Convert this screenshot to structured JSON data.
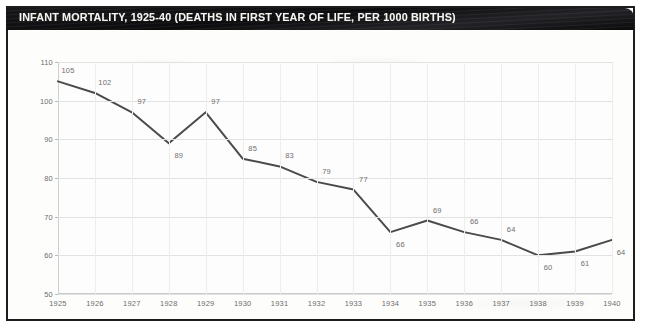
{
  "title": "INFANT MORTALITY, 1925-40 (DEATHS IN FIRST YEAR OF LIFE, PER 1000 BIRTHS)",
  "colors": {
    "banner_background": "#101012",
    "banner_text": "#f3f3f0",
    "line": "#4a4a4a",
    "gridline": "#e2e2e2",
    "tick_text": "#6d6d6d",
    "data_label_text": "#6f6f6f",
    "panel_background": "#fdfdfd",
    "card_border": "#1d1d1d"
  },
  "chart_data": {
    "type": "line",
    "title": "INFANT MORTALITY, 1925-40 (DEATHS IN FIRST YEAR OF LIFE, PER 1000 BIRTHS)",
    "xlabel": "",
    "ylabel": "",
    "x": [
      1925,
      1926,
      1927,
      1928,
      1929,
      1930,
      1931,
      1932,
      1933,
      1934,
      1935,
      1936,
      1937,
      1938,
      1939,
      1940
    ],
    "categories": [
      "1925",
      "1926",
      "1927",
      "1928",
      "1929",
      "1930",
      "1931",
      "1932",
      "1933",
      "1934",
      "1935",
      "1936",
      "1937",
      "1938",
      "1939",
      "1940"
    ],
    "values": [
      105,
      102,
      97,
      89,
      97,
      85,
      83,
      79,
      77,
      66,
      69,
      66,
      64,
      60,
      61,
      64
    ],
    "point_labels": [
      "105",
      "102",
      "97",
      "89",
      "97",
      "85",
      "83",
      "79",
      "77",
      "66",
      "69",
      "66",
      "64",
      "60",
      "61",
      "64"
    ],
    "label_positions": [
      "above",
      "above",
      "above",
      "below",
      "above",
      "above",
      "above",
      "above",
      "above",
      "below",
      "above",
      "above",
      "above",
      "below",
      "below",
      "below"
    ],
    "ylim": [
      50,
      110
    ],
    "yticks": [
      50,
      60,
      70,
      80,
      90,
      100,
      110
    ],
    "ytick_labels": [
      "50",
      "60",
      "70",
      "80",
      "90",
      "100",
      "110"
    ],
    "xlim": [
      1925,
      1940
    ],
    "grid": true,
    "grid_axis": "both",
    "legend": false,
    "legend_position": "none",
    "series": [
      {
        "name": "Infant mortality rate",
        "values": [
          105,
          102,
          97,
          89,
          97,
          85,
          83,
          79,
          77,
          66,
          69,
          66,
          64,
          60,
          61,
          64
        ]
      }
    ]
  }
}
